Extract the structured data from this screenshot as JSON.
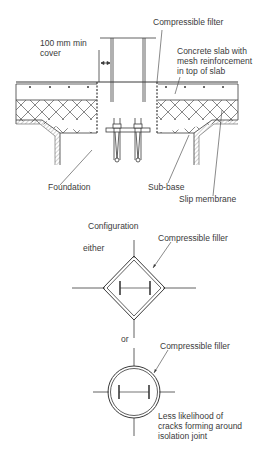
{
  "section": {
    "labels": {
      "compressible_filter": "Compressible filter",
      "min_cover": "100 mm min\ncover",
      "concrete_slab": "Concrete slab with\nmesh reinforcement\nin top of slab",
      "foundation": "Foundation",
      "sub_base": "Sub-base",
      "slip_membrane": "Slip membrane"
    }
  },
  "configuration": {
    "title": "Configuration",
    "option_1": {
      "label": "either",
      "shape": "diamond",
      "filler_label": "Compressible filler"
    },
    "option_2": {
      "label": "or",
      "shape": "circle",
      "filler_label": "Compressible filler",
      "note": "Less likelihood of\ncracks forming around\nisolation joint"
    }
  },
  "colors": {
    "line": "#3a3a3a",
    "hatch": "#555555",
    "background": "#ffffff"
  }
}
